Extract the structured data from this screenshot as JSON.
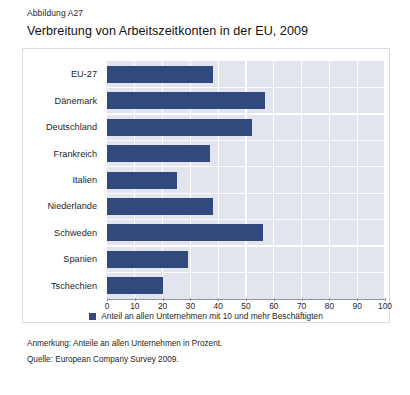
{
  "figure": {
    "label": "Abbildung A27",
    "title": "Verbreitung von Arbeitszeitkonten in der EU, 2009"
  },
  "notes": {
    "annotation": "Anmerkung: Anteile an allen Unternehmen in Prozent.",
    "source": "Quelle: European Company Survey 2009."
  },
  "colors": {
    "bar": "#31497c",
    "plot_background": "#e2e5ee",
    "gridline": "#ffffff",
    "frame_border": "#d8dbe4"
  },
  "chart_data": {
    "type": "bar",
    "orientation": "horizontal",
    "title": "Verbreitung von Arbeitszeitkonten in der EU, 2009",
    "xlabel": "",
    "ylabel": "",
    "xlim": [
      0,
      100
    ],
    "xticks": [
      0,
      10,
      20,
      30,
      40,
      50,
      60,
      70,
      80,
      90,
      100
    ],
    "grid": true,
    "legend_position": "bottom",
    "categories": [
      "EU-27",
      "Dänemark",
      "Deutschland",
      "Frankreich",
      "Italien",
      "Niederlande",
      "Schweden",
      "Spanien",
      "Tschechien"
    ],
    "series": [
      {
        "name": "Anteil an allen Unternehmen mit 10 und mehr Beschäftigten",
        "values": [
          38,
          57,
          52,
          37,
          25,
          38,
          56,
          29,
          20
        ]
      }
    ]
  }
}
